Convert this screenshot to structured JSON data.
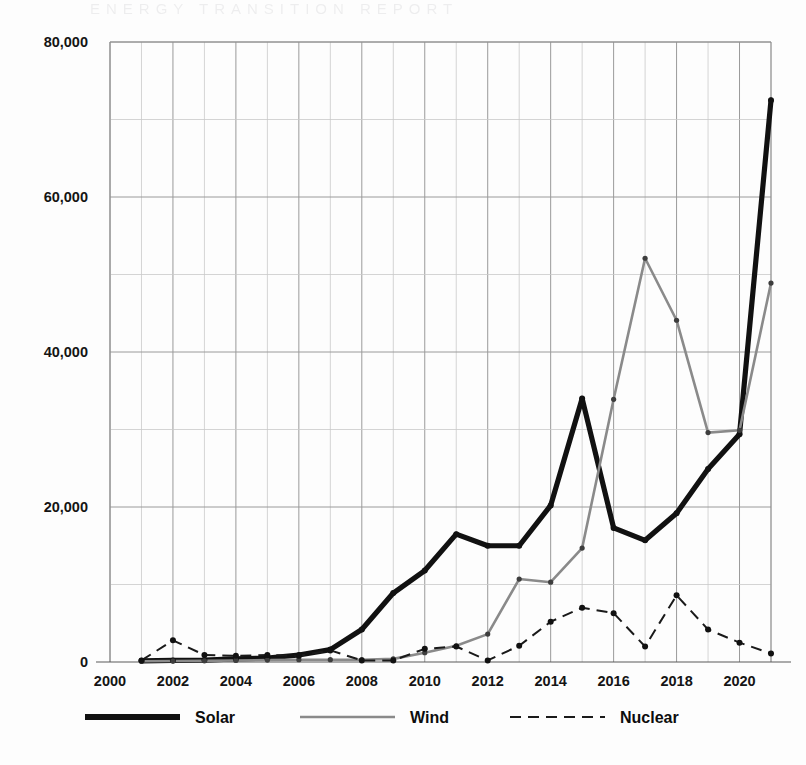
{
  "scan_artifact": {
    "bleed_text": "ENERGY  TRANSITION  REPORT"
  },
  "colors": {
    "solar": "#111111",
    "wind": "#8a8a8a",
    "nuclear": "#1a1a1a",
    "grid_minor": "#c9c9c9",
    "grid_major": "#9a9a9a",
    "background": "#fdfdfd"
  },
  "chart_data": {
    "type": "line",
    "title": "",
    "xlabel": "",
    "ylabel": "",
    "xlim": [
      2000,
      2021
    ],
    "ylim": [
      0,
      80000
    ],
    "grid": true,
    "legend_position": "bottom",
    "ytick_labels": [
      "0",
      "20,000",
      "40,000",
      "60,000",
      "80,000"
    ],
    "ytick_values": [
      0,
      20000,
      40000,
      60000,
      80000
    ],
    "yminor_values": [
      10000,
      30000,
      50000,
      70000
    ],
    "xtick_labels": [
      "2000",
      "2002",
      "2004",
      "2006",
      "2008",
      "2010",
      "2012",
      "2014",
      "2016",
      "2018",
      "2020"
    ],
    "xtick_values": [
      2000,
      2002,
      2004,
      2006,
      2008,
      2010,
      2012,
      2014,
      2016,
      2018,
      2020
    ],
    "x": [
      2001,
      2002,
      2003,
      2004,
      2005,
      2006,
      2007,
      2008,
      2009,
      2010,
      2011,
      2012,
      2013,
      2014,
      2015,
      2016,
      2017,
      2018,
      2019,
      2020,
      2021
    ],
    "series": [
      {
        "name": "Solar",
        "style": "thick-solid",
        "color": "#111111",
        "values": [
          150,
          200,
          250,
          400,
          500,
          900,
          1600,
          4200,
          8900,
          11800,
          16500,
          15000,
          15000,
          20200,
          34000,
          17300,
          15700,
          19200,
          24900,
          29400,
          72500
        ]
      },
      {
        "name": "Wind",
        "style": "thin-solid",
        "color": "#8a8a8a",
        "values": [
          100,
          120,
          150,
          200,
          250,
          300,
          300,
          300,
          400,
          1200,
          2100,
          3600,
          10700,
          10300,
          14700,
          33900,
          52100,
          44100,
          29600,
          29900,
          48900
        ]
      },
      {
        "name": "Nuclear",
        "style": "dashed",
        "color": "#1a1a1a",
        "values": [
          200,
          2800,
          900,
          800,
          900,
          800,
          1500,
          200,
          200,
          1700,
          2000,
          200,
          2100,
          5200,
          7000,
          6300,
          2000,
          8600,
          4200,
          2500,
          1100
        ]
      }
    ]
  },
  "legend": {
    "items": [
      {
        "label": "Solar",
        "style": "thick-solid"
      },
      {
        "label": "Wind",
        "style": "thin-solid"
      },
      {
        "label": "Nuclear",
        "style": "dashed"
      }
    ]
  }
}
